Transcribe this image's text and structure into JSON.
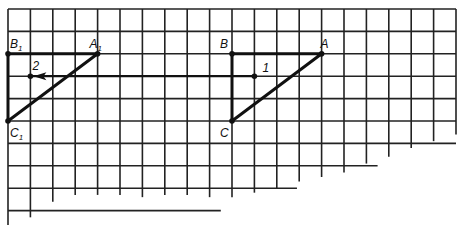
{
  "figure": {
    "grid_columns": 20,
    "grid_rows": 9,
    "colors": {
      "ink": "#111111",
      "grid": "#222222",
      "background": "#ffffff"
    }
  },
  "points": [
    {
      "id": "A",
      "label": "A",
      "sub": "",
      "col": 14,
      "row": 2
    },
    {
      "id": "B",
      "label": "B",
      "sub": "",
      "col": 10,
      "row": 2
    },
    {
      "id": "C",
      "label": "C",
      "sub": "",
      "col": 10,
      "row": 5
    },
    {
      "id": "A1",
      "label": "A",
      "sub": "1",
      "col": 4,
      "row": 2
    },
    {
      "id": "B1",
      "label": "B",
      "sub": "1",
      "col": 0,
      "row": 2
    },
    {
      "id": "C1",
      "label": "C",
      "sub": "1",
      "col": 0,
      "row": 5
    },
    {
      "id": "P1",
      "label": "1",
      "sub": "",
      "col": 11,
      "row": 3
    },
    {
      "id": "P2",
      "label": "2",
      "sub": "",
      "col": 1,
      "row": 3
    }
  ],
  "triangles": [
    {
      "name": "triangle-abc",
      "vertices": [
        "A",
        "B",
        "C"
      ]
    },
    {
      "name": "triangle-a1b1c1",
      "vertices": [
        "A1",
        "B1",
        "C1"
      ]
    }
  ],
  "translation_vector": {
    "from": "P1",
    "to": "P2",
    "label": "translation"
  }
}
